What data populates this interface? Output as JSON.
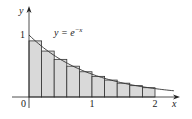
{
  "chart_data": {
    "type": "bar",
    "title": "",
    "curve_label": "y = e",
    "curve_exponent": "−x",
    "xlabel": "x",
    "ylabel": "y",
    "x_ticks": [
      {
        "value": 0,
        "label": "0"
      },
      {
        "value": 1,
        "label": "1"
      },
      {
        "value": 2,
        "label": "2"
      }
    ],
    "y_ticks": [
      {
        "value": 1,
        "label": "1"
      }
    ],
    "xlim": [
      0,
      2.3
    ],
    "ylim": [
      0,
      1.4
    ],
    "grid": false,
    "legend": "none",
    "n_rectangles": 10,
    "rect_width": 0.2,
    "rect_left_edges": [
      0,
      0.2,
      0.4,
      0.6,
      0.8,
      1.0,
      1.2,
      1.4,
      1.6,
      1.8
    ],
    "sample_points": [
      0.1,
      0.3,
      0.5,
      0.7,
      0.9,
      1.1,
      1.3,
      1.5,
      1.7,
      1.9
    ],
    "values": [
      0.905,
      0.741,
      0.607,
      0.497,
      0.407,
      0.333,
      0.273,
      0.223,
      0.183,
      0.15
    ],
    "curve_range": [
      0,
      2.3
    ],
    "colors": {
      "rect_fill": "#d9d9d9",
      "rect_stroke": "#333333",
      "curve": "#333333",
      "axis": "#222222"
    }
  }
}
